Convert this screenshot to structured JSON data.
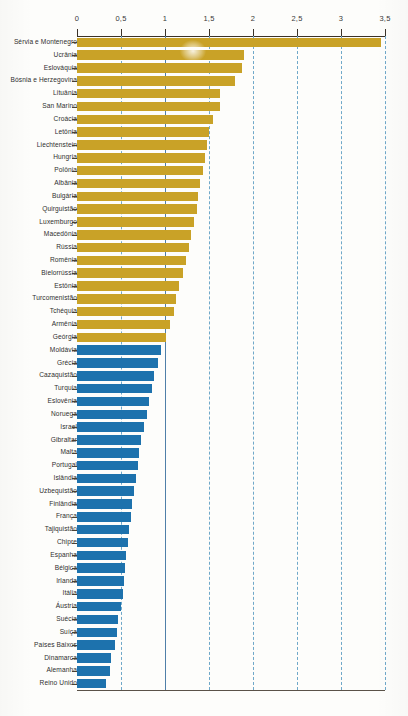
{
  "chart_data": {
    "type": "bar",
    "orientation": "horizontal",
    "title": "",
    "xlabel": "",
    "ylabel": "",
    "xlim": [
      0,
      3.5
    ],
    "xticks": [
      "0",
      "0,5",
      "1",
      "1,5",
      "2",
      "2,5",
      "3",
      "3,5"
    ],
    "xtick_values": [
      0,
      0.5,
      1,
      1.5,
      2,
      2.5,
      3,
      3.5
    ],
    "grid": true,
    "reference_line": 1,
    "legend": [],
    "colors": {
      "above_reference": "#c9a227",
      "below_reference": "#1d72ad",
      "gridline": "#6fa8c9",
      "reference_line": "#4f7fa8",
      "axis": "#3b3228"
    },
    "categories": [
      "Sérvia e Montenegro",
      "Ucrânia",
      "Eslováquia",
      "Bósnia e Herzegovina",
      "Lituânia",
      "San Marino",
      "Croácia",
      "Letônia",
      "Liechtenstein",
      "Hungria",
      "Polônia",
      "Albânia",
      "Bulgária",
      "Quirguistão",
      "Luxemburgo",
      "Macedônia",
      "Rússia",
      "Romênia",
      "Bielorrússia",
      "Estônia",
      "Turcomenistão",
      "Tchéquia",
      "Armênia",
      "Geórgia",
      "Moldávia",
      "Grécia",
      "Cazaquistão",
      "Turquia",
      "Eslovênia",
      "Noruega",
      "Israel",
      "Gibraltar",
      "Malta",
      "Portugal",
      "Islândia",
      "Uzbequistão",
      "Finlândia",
      "França",
      "Tajiquistão",
      "Chipre",
      "Espanha",
      "Bélgica",
      "Irlanda",
      "Itália",
      "Áustria",
      "Suécia",
      "Suíça",
      "Países Baixos",
      "Dinamarca",
      "Alemanha",
      "Reino Unido"
    ],
    "values": [
      3.45,
      1.9,
      1.88,
      1.8,
      1.62,
      1.62,
      1.55,
      1.5,
      1.48,
      1.46,
      1.43,
      1.4,
      1.38,
      1.36,
      1.33,
      1.3,
      1.27,
      1.24,
      1.2,
      1.16,
      1.13,
      1.1,
      1.06,
      1.01,
      0.96,
      0.92,
      0.88,
      0.85,
      0.82,
      0.79,
      0.76,
      0.73,
      0.71,
      0.69,
      0.67,
      0.65,
      0.63,
      0.61,
      0.59,
      0.58,
      0.56,
      0.55,
      0.53,
      0.52,
      0.5,
      0.47,
      0.45,
      0.43,
      0.39,
      0.37,
      0.33
    ]
  },
  "caption": {
    "text": ""
  }
}
